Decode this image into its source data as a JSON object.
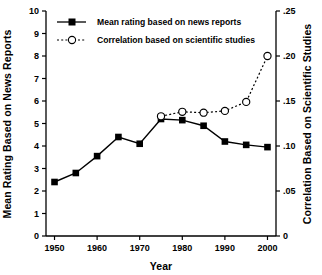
{
  "chart_data": {
    "type": "line",
    "title": "",
    "xlabel": "Year",
    "ylabel": "Mean Rating Based on News Reports",
    "y2label": "Correlation Based on Scientific Studies",
    "x": [
      1950,
      1955,
      1960,
      1965,
      1970,
      1975,
      1980,
      1985,
      1990,
      1995,
      2000
    ],
    "xlim": [
      1948,
      2002
    ],
    "ylim": [
      0,
      10
    ],
    "y2lim": [
      0,
      0.25
    ],
    "xticks": [
      1950,
      1960,
      1970,
      1980,
      1990,
      2000
    ],
    "xtick_labels": [
      "1950",
      "1960",
      "1970",
      "1980",
      "1990",
      "2000"
    ],
    "yticks": [
      0,
      1,
      2,
      3,
      4,
      5,
      6,
      7,
      8,
      9,
      10
    ],
    "ytick_labels": [
      "0",
      "1",
      "2",
      "3",
      "4",
      "5",
      "6",
      "7",
      "8",
      "9",
      "10"
    ],
    "y2ticks": [
      0,
      0.05,
      0.1,
      0.15,
      0.2,
      0.25
    ],
    "y2tick_labels": [
      "0",
      ".05",
      ".10",
      ".15",
      ".20",
      ".25"
    ],
    "grid": false,
    "legend_position": "top-left",
    "series": [
      {
        "name": "Mean rating based on news reports",
        "axis": "left",
        "marker": "filled-square",
        "line_style": "solid",
        "color": "#000000",
        "x": [
          1950,
          1955,
          1960,
          1965,
          1970,
          1975,
          1980,
          1985,
          1990,
          1995,
          2000
        ],
        "values": [
          2.4,
          2.8,
          3.55,
          4.4,
          4.1,
          5.2,
          5.15,
          4.9,
          4.2,
          4.05,
          3.95
        ]
      },
      {
        "name": "Correlation based on scientific studies",
        "axis": "right",
        "marker": "open-circle",
        "line_style": "dotted",
        "color": "#000000",
        "x": [
          1975,
          1980,
          1985,
          1990,
          1995,
          2000
        ],
        "values": [
          0.133,
          0.138,
          0.137,
          0.139,
          0.149,
          0.2
        ]
      }
    ]
  },
  "legend": {
    "entries": [
      {
        "label": "Mean rating based on news reports"
      },
      {
        "label": "Correlation based on scientific studies"
      }
    ]
  }
}
